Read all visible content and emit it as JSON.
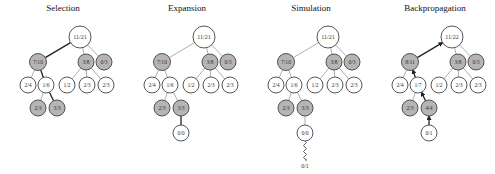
{
  "panels": [
    {
      "title": "Selection",
      "offset_x": 0,
      "nodes": [
        {
          "id": "root",
          "label": "11/21",
          "x": 80,
          "y": 37,
          "r": 11,
          "fill": "white"
        },
        {
          "id": "a",
          "label": "7/10",
          "x": 38,
          "y": 62,
          "r": 8.5,
          "fill": "gray"
        },
        {
          "id": "b",
          "label": "3/8",
          "x": 86,
          "y": 62,
          "r": 8,
          "fill": "gray"
        },
        {
          "id": "c",
          "label": "0/3",
          "x": 104,
          "y": 62,
          "r": 8,
          "fill": "gray"
        },
        {
          "id": "a1",
          "label": "2/4",
          "x": 28,
          "y": 85,
          "r": 8,
          "fill": "white"
        },
        {
          "id": "a2",
          "label": "1/6",
          "x": 46,
          "y": 85,
          "r": 8,
          "fill": "white"
        },
        {
          "id": "b1",
          "label": "1/2",
          "x": 67,
          "y": 85,
          "r": 8,
          "fill": "white"
        },
        {
          "id": "b2",
          "label": "2/3",
          "x": 87,
          "y": 85,
          "r": 8,
          "fill": "white"
        },
        {
          "id": "b3",
          "label": "2/3",
          "x": 106,
          "y": 85,
          "r": 8,
          "fill": "white"
        },
        {
          "id": "a21",
          "label": "2/3",
          "x": 38,
          "y": 108,
          "r": 8,
          "fill": "gray"
        },
        {
          "id": "a22",
          "label": "3/3",
          "x": 57,
          "y": 108,
          "r": 8,
          "fill": "gray"
        }
      ],
      "edges": [
        {
          "from": "root",
          "to": "a",
          "bold": true
        },
        {
          "from": "root",
          "to": "b",
          "bold": false
        },
        {
          "from": "root",
          "to": "c",
          "bold": false
        },
        {
          "from": "a",
          "to": "a1",
          "bold": false
        },
        {
          "from": "a",
          "to": "a2",
          "bold": true
        },
        {
          "from": "b",
          "to": "b1",
          "bold": false
        },
        {
          "from": "b",
          "to": "b2",
          "bold": false
        },
        {
          "from": "b",
          "to": "b3",
          "bold": false
        },
        {
          "from": "a2",
          "to": "a21",
          "bold": false
        },
        {
          "from": "a2",
          "to": "a22",
          "bold": true
        }
      ]
    },
    {
      "title": "Expansion",
      "offset_x": 124,
      "nodes": [
        {
          "id": "root",
          "label": "11/21",
          "x": 80,
          "y": 37,
          "r": 11,
          "fill": "white"
        },
        {
          "id": "a",
          "label": "7/10",
          "x": 38,
          "y": 62,
          "r": 8.5,
          "fill": "gray"
        },
        {
          "id": "b",
          "label": "3/8",
          "x": 86,
          "y": 62,
          "r": 8,
          "fill": "gray"
        },
        {
          "id": "c",
          "label": "0/3",
          "x": 104,
          "y": 62,
          "r": 8,
          "fill": "gray"
        },
        {
          "id": "a1",
          "label": "2/4",
          "x": 28,
          "y": 85,
          "r": 8,
          "fill": "white"
        },
        {
          "id": "a2",
          "label": "1/6",
          "x": 46,
          "y": 85,
          "r": 8,
          "fill": "white"
        },
        {
          "id": "b1",
          "label": "1/2",
          "x": 67,
          "y": 85,
          "r": 8,
          "fill": "white"
        },
        {
          "id": "b2",
          "label": "2/3",
          "x": 87,
          "y": 85,
          "r": 8,
          "fill": "white"
        },
        {
          "id": "b3",
          "label": "2/3",
          "x": 106,
          "y": 85,
          "r": 8,
          "fill": "white"
        },
        {
          "id": "a21",
          "label": "2/3",
          "x": 38,
          "y": 108,
          "r": 8,
          "fill": "gray"
        },
        {
          "id": "a22",
          "label": "3/3",
          "x": 57,
          "y": 108,
          "r": 8,
          "fill": "gray"
        },
        {
          "id": "new",
          "label": "0/0",
          "x": 57,
          "y": 133,
          "r": 8,
          "fill": "white"
        }
      ],
      "edges": [
        {
          "from": "root",
          "to": "a",
          "bold": false
        },
        {
          "from": "root",
          "to": "b",
          "bold": false
        },
        {
          "from": "root",
          "to": "c",
          "bold": false
        },
        {
          "from": "a",
          "to": "a1",
          "bold": false
        },
        {
          "from": "a",
          "to": "a2",
          "bold": false
        },
        {
          "from": "b",
          "to": "b1",
          "bold": false
        },
        {
          "from": "b",
          "to": "b2",
          "bold": false
        },
        {
          "from": "b",
          "to": "b3",
          "bold": false
        },
        {
          "from": "a2",
          "to": "a21",
          "bold": false
        },
        {
          "from": "a2",
          "to": "a22",
          "bold": false
        },
        {
          "from": "a22",
          "to": "new",
          "bold": true
        }
      ]
    },
    {
      "title": "Simulation",
      "offset_x": 248,
      "nodes": [
        {
          "id": "root",
          "label": "11/21",
          "x": 80,
          "y": 37,
          "r": 11,
          "fill": "white"
        },
        {
          "id": "a",
          "label": "7/10",
          "x": 38,
          "y": 62,
          "r": 8.5,
          "fill": "gray"
        },
        {
          "id": "b",
          "label": "3/8",
          "x": 86,
          "y": 62,
          "r": 8,
          "fill": "gray"
        },
        {
          "id": "c",
          "label": "0/3",
          "x": 104,
          "y": 62,
          "r": 8,
          "fill": "gray"
        },
        {
          "id": "a1",
          "label": "2/4",
          "x": 28,
          "y": 85,
          "r": 8,
          "fill": "white"
        },
        {
          "id": "a2",
          "label": "1/6",
          "x": 46,
          "y": 85,
          "r": 8,
          "fill": "white"
        },
        {
          "id": "b1",
          "label": "1/2",
          "x": 67,
          "y": 85,
          "r": 8,
          "fill": "white"
        },
        {
          "id": "b2",
          "label": "2/3",
          "x": 87,
          "y": 85,
          "r": 8,
          "fill": "white"
        },
        {
          "id": "b3",
          "label": "2/3",
          "x": 106,
          "y": 85,
          "r": 8,
          "fill": "white"
        },
        {
          "id": "a21",
          "label": "2/3",
          "x": 38,
          "y": 108,
          "r": 8,
          "fill": "gray"
        },
        {
          "id": "a22",
          "label": "3/3",
          "x": 57,
          "y": 108,
          "r": 8,
          "fill": "gray"
        },
        {
          "id": "new",
          "label": "0/0",
          "x": 57,
          "y": 133,
          "r": 8,
          "fill": "white"
        }
      ],
      "edges": [
        {
          "from": "root",
          "to": "a",
          "bold": false
        },
        {
          "from": "root",
          "to": "b",
          "bold": false
        },
        {
          "from": "root",
          "to": "c",
          "bold": false
        },
        {
          "from": "a",
          "to": "a1",
          "bold": false
        },
        {
          "from": "a",
          "to": "a2",
          "bold": false
        },
        {
          "from": "b",
          "to": "b1",
          "bold": false
        },
        {
          "from": "b",
          "to": "b2",
          "bold": false
        },
        {
          "from": "b",
          "to": "b3",
          "bold": false
        },
        {
          "from": "a2",
          "to": "a21",
          "bold": false
        },
        {
          "from": "a2",
          "to": "a22",
          "bold": false
        },
        {
          "from": "a22",
          "to": "new",
          "bold": false
        }
      ],
      "simulation": {
        "from": "new",
        "result_label": "0/1",
        "result_y": 168
      }
    },
    {
      "title": "Backpropagation",
      "offset_x": 372,
      "nodes": [
        {
          "id": "root",
          "label": "11/22",
          "x": 80,
          "y": 37,
          "r": 11,
          "fill": "white"
        },
        {
          "id": "a",
          "label": "8/11",
          "x": 38,
          "y": 62,
          "r": 8.5,
          "fill": "gray"
        },
        {
          "id": "b",
          "label": "3/8",
          "x": 86,
          "y": 62,
          "r": 8,
          "fill": "gray"
        },
        {
          "id": "c",
          "label": "0/3",
          "x": 104,
          "y": 62,
          "r": 8,
          "fill": "gray"
        },
        {
          "id": "a1",
          "label": "2/4",
          "x": 28,
          "y": 85,
          "r": 8,
          "fill": "white"
        },
        {
          "id": "a2",
          "label": "1/7",
          "x": 46,
          "y": 85,
          "r": 8,
          "fill": "white"
        },
        {
          "id": "b1",
          "label": "1/2",
          "x": 67,
          "y": 85,
          "r": 8,
          "fill": "white"
        },
        {
          "id": "b2",
          "label": "2/3",
          "x": 87,
          "y": 85,
          "r": 8,
          "fill": "white"
        },
        {
          "id": "b3",
          "label": "2/3",
          "x": 106,
          "y": 85,
          "r": 8,
          "fill": "white"
        },
        {
          "id": "a21",
          "label": "2/3",
          "x": 38,
          "y": 108,
          "r": 8,
          "fill": "gray"
        },
        {
          "id": "a22",
          "label": "4/4",
          "x": 57,
          "y": 108,
          "r": 8,
          "fill": "gray"
        },
        {
          "id": "new",
          "label": "0/1",
          "x": 57,
          "y": 133,
          "r": 8,
          "fill": "white"
        }
      ],
      "edges": [
        {
          "from": "root",
          "to": "a",
          "bold": true,
          "arrow": true
        },
        {
          "from": "root",
          "to": "b",
          "bold": false
        },
        {
          "from": "root",
          "to": "c",
          "bold": false
        },
        {
          "from": "a",
          "to": "a1",
          "bold": false
        },
        {
          "from": "a",
          "to": "a2",
          "bold": true,
          "arrow": true
        },
        {
          "from": "b",
          "to": "b1",
          "bold": false
        },
        {
          "from": "b",
          "to": "b2",
          "bold": false
        },
        {
          "from": "b",
          "to": "b3",
          "bold": false
        },
        {
          "from": "a2",
          "to": "a21",
          "bold": false
        },
        {
          "from": "a2",
          "to": "a22",
          "bold": true,
          "arrow": true
        },
        {
          "from": "a22",
          "to": "new",
          "bold": true,
          "arrow": true
        }
      ]
    }
  ],
  "colors": {
    "gray_node": "#b5b5b5",
    "white_node": "#ffffff",
    "node_stroke": "#444444",
    "edge_light": "#9a9a9a",
    "edge_bold": "#222222"
  }
}
